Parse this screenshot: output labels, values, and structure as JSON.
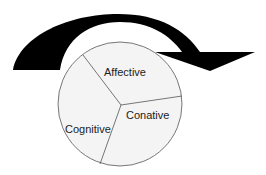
{
  "diagram": {
    "title": "",
    "segments": [
      {
        "label": "Affective"
      },
      {
        "label": "Conative"
      },
      {
        "label": "Cognitive"
      }
    ],
    "arrow": {
      "direction": "clockwise",
      "color": "#000000"
    },
    "colors": {
      "pie_fill": "#f4f4f4",
      "pie_stroke": "#555555"
    }
  }
}
